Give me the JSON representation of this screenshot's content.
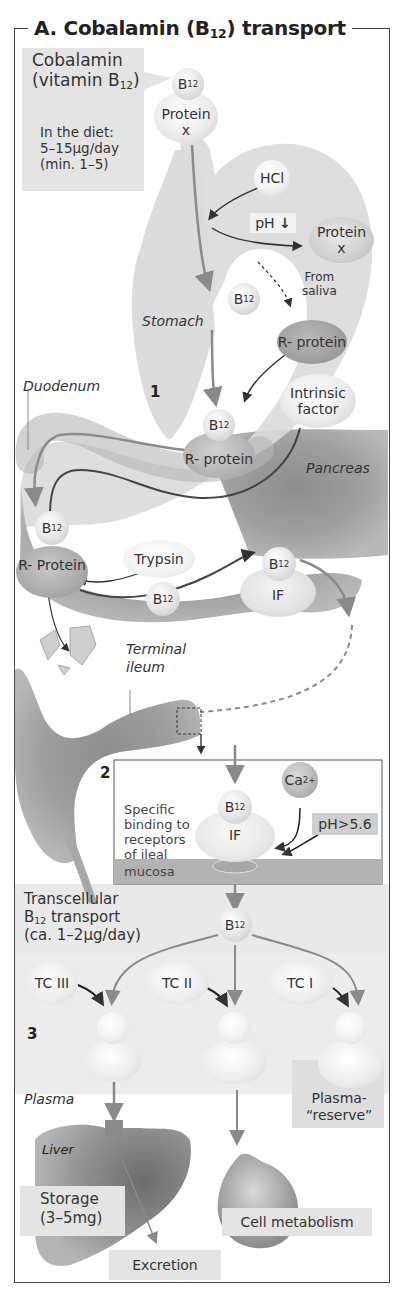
{
  "title": {
    "prefix": "A. Cobalamin (B",
    "sub": "12",
    "suffix": ") transport"
  },
  "section1": {
    "number": "1",
    "cobalamin_box": {
      "line1": "Cobalamin",
      "line2_prefix": "(vitamin B",
      "line2_sub": "12",
      "line2_suffix": ")",
      "diet_line1": "In the diet:",
      "diet_line2": "5–15µg/day",
      "diet_line3": "(min. 1–5)"
    },
    "b12_label": "B",
    "b12_sub": "12",
    "protein_x_line1": "Protein",
    "protein_x_line2": "x",
    "hcl": "HCl",
    "ph_down": "pH",
    "ph_down_arrow": "↓",
    "protein_x_free_line1": "Protein",
    "protein_x_free_line2": "x",
    "from_saliva_line1": "From",
    "from_saliva_line2": "saliva",
    "stomach": "Stomach",
    "r_protein": "R- protein",
    "intrinsic_factor_line1": "Intrinsic",
    "intrinsic_factor_line2": "factor",
    "duodenum": "Duodenum",
    "r_protein_complex": "R- protein",
    "pancreas": "Pancreas",
    "r_protein_duodenum": "R- Protein",
    "trypsin": "Trypsin",
    "if_label": "IF",
    "terminal_ileum_line1": "Terminal",
    "terminal_ileum_line2": "ileum"
  },
  "section2": {
    "number": "2",
    "ca": "Ca",
    "ca_sup": "2+",
    "binding_line1": "Specific",
    "binding_line2": "binding to",
    "binding_line3": "receptors",
    "binding_line4": "of ileal",
    "mucosa": "mucosa",
    "ph_gt": "pH>5.6",
    "if_label": "IF",
    "transcellular_line1": "Transcellular",
    "transcellular_line2_prefix": "B",
    "transcellular_line2_sub": "12",
    "transcellular_line2_suffix": " transport",
    "transcellular_line3": "(ca. 1–2µg/day)"
  },
  "section3": {
    "number": "3",
    "tc3": "TC III",
    "tc2": "TC II",
    "tc1": "TC I",
    "plasma": "Plasma",
    "plasma_reserve_line1": "Plasma-",
    "plasma_reserve_line2": "“reserve”",
    "liver": "Liver",
    "storage_line1": "Storage",
    "storage_line2": "(3–5mg)",
    "excretion": "Excretion",
    "cell_metabolism": "Cell metabolism"
  },
  "colors": {
    "arrow_gray": "#8a8a8a",
    "arrow_dark": "#333333",
    "label_box": "#e4e4e4",
    "mucosa": "#b3b3b3",
    "tissue": "#9e9e9e"
  }
}
